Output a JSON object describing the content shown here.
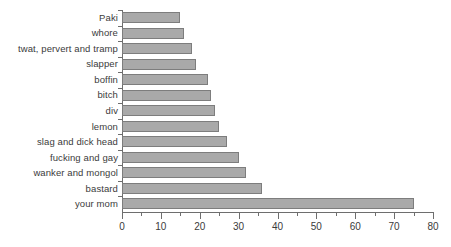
{
  "chart_data": {
    "type": "bar",
    "orientation": "horizontal",
    "title": "",
    "subtitle": "",
    "xlabel": "",
    "ylabel": "",
    "xlim": [
      0,
      80
    ],
    "ylim": null,
    "grid": false,
    "legend": null,
    "legend_position": "none",
    "xticks": [
      0,
      10,
      20,
      30,
      40,
      50,
      60,
      70,
      80
    ],
    "xtick_labels": [
      "0",
      "10",
      "20",
      "30",
      "40",
      "50",
      "60",
      "70",
      "80"
    ],
    "minor_xticks": [
      5,
      15,
      25,
      35,
      45,
      55,
      65,
      75
    ],
    "categories": [
      "Paki",
      "whore",
      "twat, pervert and tramp",
      "slapper",
      "boffin",
      "bitch",
      "div",
      "lemon",
      "slag and dick head",
      "fucking and gay",
      "wanker and mongol",
      "bastard",
      "your mom"
    ],
    "values": [
      15,
      16,
      18,
      19,
      22,
      23,
      24,
      25,
      27,
      30,
      32,
      36,
      75
    ],
    "bar_color": "#a9a9a9",
    "bar_edge_color": "#7d7d7d",
    "axis_color": "#6e6e6e",
    "text_color": "#3b3b3b",
    "background_color": "#ffffff"
  }
}
